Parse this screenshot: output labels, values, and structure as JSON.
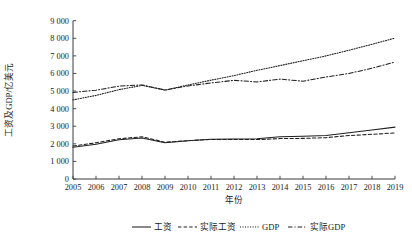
{
  "chart_data": {
    "type": "line",
    "title": "",
    "xlabel": "年份",
    "ylabel": "工资及GDP/亿美元",
    "x": [
      2005,
      2006,
      2007,
      2008,
      2009,
      2010,
      2011,
      2012,
      2013,
      2014,
      2015,
      2016,
      2017,
      2018,
      2019
    ],
    "xlim": [
      2005,
      2019
    ],
    "ylim": [
      0,
      9000
    ],
    "yticks": [
      0,
      1000,
      2000,
      3000,
      4000,
      5000,
      6000,
      7000,
      8000,
      9000
    ],
    "ytick_labels": [
      "0",
      "1 000",
      "2 000",
      "3 000",
      "4 000",
      "5 000",
      "6 000",
      "7 000",
      "8 000",
      "9 000"
    ],
    "xtick_labels": [
      "2005",
      "2006",
      "2007",
      "2008",
      "2009",
      "2010",
      "2011",
      "2012",
      "2013",
      "2014",
      "2015",
      "2016",
      "2017",
      "2018",
      "2019"
    ],
    "grid": false,
    "legend_position": "bottom",
    "series": [
      {
        "name": "工资",
        "style": "solid",
        "values": [
          1800,
          1980,
          2230,
          2330,
          2060,
          2180,
          2260,
          2280,
          2290,
          2400,
          2430,
          2470,
          2630,
          2780,
          2950
        ]
      },
      {
        "name": "实际工资",
        "style": "dashed",
        "values": [
          1880,
          2060,
          2290,
          2400,
          2090,
          2180,
          2250,
          2250,
          2240,
          2300,
          2310,
          2350,
          2470,
          2540,
          2620
        ]
      },
      {
        "name": "GDP",
        "style": "dotted",
        "values": [
          4500,
          4750,
          5080,
          5320,
          5050,
          5350,
          5620,
          5880,
          6180,
          6450,
          6720,
          7000,
          7320,
          7660,
          8010
        ]
      },
      {
        "name": "实际GDP",
        "style": "dashdot",
        "values": [
          4920,
          5050,
          5280,
          5350,
          5060,
          5290,
          5460,
          5610,
          5520,
          5680,
          5560,
          5800,
          6000,
          6300,
          6650
        ]
      }
    ]
  },
  "legend": {
    "items": [
      {
        "label": "工资",
        "style": "solid"
      },
      {
        "label": "实际工资",
        "style": "dashed"
      },
      {
        "label": "GDP",
        "style": "dotted"
      },
      {
        "label": "实际GDP",
        "style": "dashdot"
      }
    ]
  }
}
